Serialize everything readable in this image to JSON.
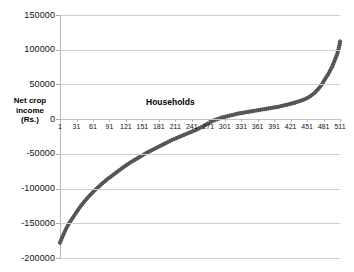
{
  "chart_data": {
    "type": "scatter",
    "title": "",
    "xlabel": "Households",
    "ylabel": "Net crop income (Rs.)",
    "ylim": [
      -200000,
      150000
    ],
    "ytick_values": [
      150000,
      100000,
      50000,
      0,
      -50000,
      -100000,
      -150000,
      -200000
    ],
    "ytick_labels": [
      "150000",
      "100000",
      "50000",
      "0",
      "-50000",
      "-100000",
      "-150000",
      "-200000"
    ],
    "xlim": [
      1,
      511
    ],
    "xtick_values": [
      1,
      31,
      61,
      91,
      121,
      151,
      181,
      211,
      241,
      271,
      301,
      331,
      361,
      391,
      421,
      451,
      481,
      511
    ],
    "xtick_labels": [
      "1",
      "31",
      "61",
      "91",
      "121",
      "151",
      "181",
      "211",
      "241",
      "271",
      "301",
      "331",
      "361",
      "391",
      "421",
      "451",
      "481",
      "511"
    ],
    "grid": true,
    "legend": false,
    "series_color": "#575757",
    "gridline_color": "#cfcfcf",
    "background": "#ffffff",
    "series": [
      {
        "name": "Net crop income per household (sorted ascending)",
        "x": [
          1,
          4,
          8,
          12,
          16,
          21,
          26,
          31,
          38,
          46,
          55,
          65,
          76,
          88,
          100,
          115,
          130,
          145,
          160,
          175,
          190,
          205,
          220,
          235,
          250,
          265,
          271,
          280,
          295,
          310,
          325,
          340,
          355,
          370,
          385,
          400,
          415,
          430,
          445,
          455,
          465,
          472,
          478,
          484,
          489,
          493,
          497,
          500,
          503,
          506,
          508,
          510,
          511
        ],
        "y": [
          -178000,
          -172000,
          -165000,
          -158000,
          -152000,
          -146000,
          -140000,
          -134000,
          -126000,
          -118000,
          -110000,
          -102000,
          -94000,
          -86000,
          -79000,
          -70000,
          -62000,
          -55000,
          -48000,
          -42000,
          -36000,
          -30000,
          -25000,
          -20000,
          -15000,
          -9000,
          -6000,
          -2000,
          2000,
          5000,
          8000,
          10000,
          12000,
          14000,
          16000,
          18000,
          21000,
          24000,
          28000,
          32000,
          38000,
          44000,
          50000,
          58000,
          64000,
          70000,
          76000,
          82000,
          88000,
          94000,
          100000,
          106000,
          112000
        ]
      }
    ]
  }
}
